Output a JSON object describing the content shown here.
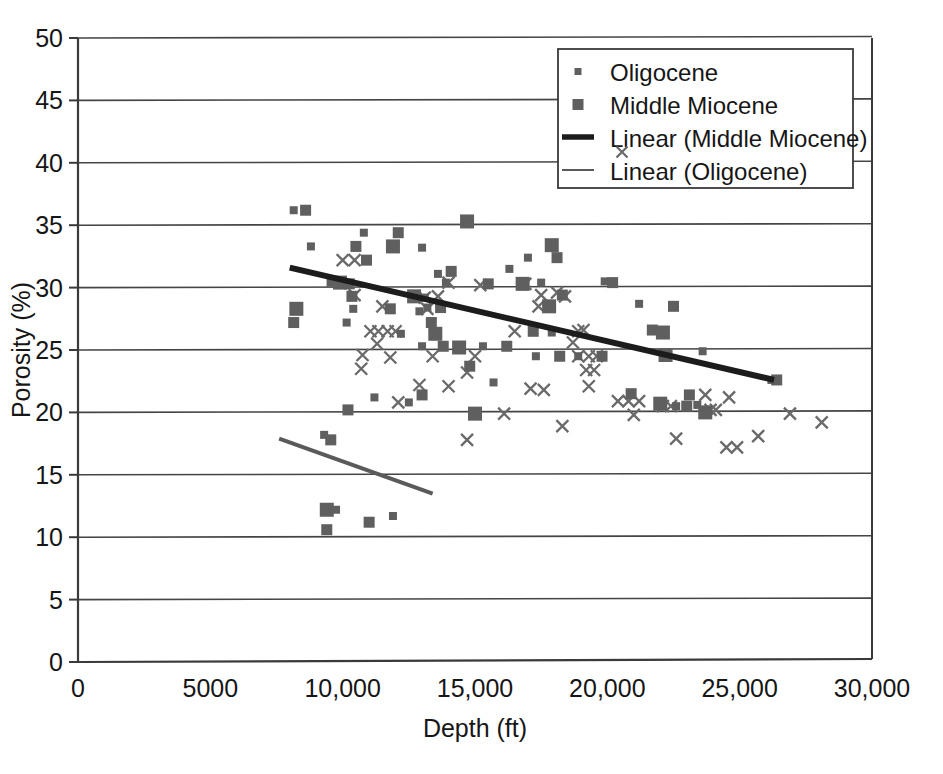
{
  "chart_data": {
    "type": "scatter",
    "title": "",
    "xlabel": "Depth (ft)",
    "ylabel": "Porosity (%)",
    "xlim": [
      0,
      30000
    ],
    "ylim": [
      0,
      50
    ],
    "xticks": [
      0,
      5000,
      10000,
      15000,
      20000,
      25000,
      30000
    ],
    "xtick_labels": [
      "0",
      "5000",
      "10,000",
      "15,000",
      "20,000",
      "25,000",
      "30,000"
    ],
    "yticks": [
      0,
      5,
      10,
      15,
      20,
      25,
      30,
      35,
      40,
      45,
      50
    ],
    "ytick_labels": [
      "0",
      "5",
      "10",
      "15",
      "20",
      "25",
      "30",
      "35",
      "40",
      "45",
      "50"
    ],
    "grid": "horizontal",
    "legend_position": "top-right",
    "marker_color": "#5f5f5f",
    "trend_miocene_color": "#1c1c1c",
    "trend_oligocene_color": "#5a5a5a",
    "axis_color": "#3a3a3a",
    "legend": [
      {
        "label": "Oligocene",
        "marker": "small-square",
        "color": "#5f5f5f"
      },
      {
        "label": "Middle Miocene",
        "marker": "square",
        "color": "#5f5f5f"
      },
      {
        "label": "Linear (Middle Miocene)",
        "marker": "thick-line",
        "color": "#1c1c1c"
      },
      {
        "label": "Linear (Oligocene)",
        "marker": "thin-line",
        "color": "#5a5a5a"
      }
    ],
    "series": [
      {
        "name": "Middle Miocene",
        "marker": "square",
        "color": "#5f5f5f",
        "points": [
          [
            8150,
            36.2
          ],
          [
            8600,
            36.2
          ],
          [
            14700,
            35.3
          ],
          [
            10800,
            34.4
          ],
          [
            12100,
            34.4
          ],
          [
            8800,
            33.3
          ],
          [
            10500,
            33.3
          ],
          [
            11900,
            33.3
          ],
          [
            13000,
            33.2
          ],
          [
            10900,
            32.2
          ],
          [
            17000,
            32.4
          ],
          [
            18100,
            32.4
          ],
          [
            17900,
            33.4
          ],
          [
            16300,
            31.5
          ],
          [
            14100,
            31.3
          ],
          [
            13600,
            31.1
          ],
          [
            9600,
            30.5
          ],
          [
            9900,
            30.4
          ],
          [
            10050,
            30.3
          ],
          [
            10250,
            30.3
          ],
          [
            13900,
            30.4
          ],
          [
            15500,
            30.3
          ],
          [
            16800,
            30.3
          ],
          [
            19900,
            30.5
          ],
          [
            20200,
            30.4
          ],
          [
            17500,
            30.4
          ],
          [
            10350,
            29.3
          ],
          [
            12700,
            29.3
          ],
          [
            13100,
            29.2
          ],
          [
            18300,
            29.4
          ],
          [
            21200,
            28.7
          ],
          [
            22500,
            28.5
          ],
          [
            8250,
            28.3
          ],
          [
            10400,
            28.3
          ],
          [
            11800,
            28.3
          ],
          [
            13200,
            28.4
          ],
          [
            13700,
            28.4
          ],
          [
            17800,
            28.5
          ],
          [
            12900,
            28.1
          ],
          [
            8150,
            27.2
          ],
          [
            10150,
            27.2
          ],
          [
            13350,
            27.2
          ],
          [
            13500,
            26.3
          ],
          [
            12200,
            26.3
          ],
          [
            17200,
            26.5
          ],
          [
            17900,
            26.4
          ],
          [
            21700,
            26.6
          ],
          [
            22100,
            26.4
          ],
          [
            13000,
            25.3
          ],
          [
            13800,
            25.3
          ],
          [
            15300,
            25.3
          ],
          [
            16200,
            25.3
          ],
          [
            14400,
            25.2
          ],
          [
            17300,
            24.5
          ],
          [
            18200,
            24.5
          ],
          [
            18900,
            24.5
          ],
          [
            19800,
            24.5
          ],
          [
            22200,
            24.6
          ],
          [
            23600,
            24.9
          ],
          [
            14800,
            23.7
          ],
          [
            15700,
            22.4
          ],
          [
            20900,
            21.5
          ],
          [
            22000,
            20.7
          ],
          [
            22600,
            20.5
          ],
          [
            23000,
            20.5
          ],
          [
            23400,
            20.6
          ],
          [
            23100,
            21.4
          ],
          [
            23700,
            20.0
          ],
          [
            11200,
            21.2
          ],
          [
            13000,
            21.4
          ],
          [
            12500,
            20.8
          ],
          [
            10200,
            20.2
          ],
          [
            15000,
            19.9
          ],
          [
            26200,
            22.6
          ],
          [
            26400,
            22.6
          ],
          [
            9300,
            18.2
          ],
          [
            9550,
            17.8
          ],
          [
            9400,
            12.2
          ],
          [
            9750,
            12.2
          ],
          [
            11000,
            11.2
          ],
          [
            11900,
            11.7
          ],
          [
            9400,
            10.6
          ]
        ]
      },
      {
        "name": "Oligocene",
        "marker": "x",
        "color": "#6a6a6a",
        "points": [
          [
            10000,
            32.2
          ],
          [
            10450,
            32.2
          ],
          [
            14000,
            30.4
          ],
          [
            15200,
            30.2
          ],
          [
            16900,
            30.3
          ],
          [
            10450,
            29.4
          ],
          [
            13100,
            29.2
          ],
          [
            13600,
            29.3
          ],
          [
            17500,
            29.4
          ],
          [
            18100,
            29.6
          ],
          [
            18400,
            29.3
          ],
          [
            11500,
            28.5
          ],
          [
            13200,
            28.3
          ],
          [
            17400,
            28.5
          ],
          [
            11050,
            26.5
          ],
          [
            11350,
            26.5
          ],
          [
            11700,
            26.5
          ],
          [
            12000,
            26.5
          ],
          [
            16500,
            26.5
          ],
          [
            18900,
            26.5
          ],
          [
            19100,
            26.6
          ],
          [
            11300,
            25.5
          ],
          [
            18700,
            25.6
          ],
          [
            10750,
            24.6
          ],
          [
            11800,
            24.4
          ],
          [
            13400,
            24.5
          ],
          [
            15000,
            24.5
          ],
          [
            18900,
            24.5
          ],
          [
            19300,
            24.5
          ],
          [
            19600,
            24.5
          ],
          [
            10700,
            23.5
          ],
          [
            19200,
            23.4
          ],
          [
            19500,
            23.4
          ],
          [
            14700,
            23.2
          ],
          [
            12900,
            22.2
          ],
          [
            14000,
            22.1
          ],
          [
            19300,
            22.1
          ],
          [
            17100,
            21.9
          ],
          [
            17600,
            21.8
          ],
          [
            12100,
            20.8
          ],
          [
            20400,
            20.9
          ],
          [
            20800,
            20.9
          ],
          [
            21200,
            20.9
          ],
          [
            16100,
            19.9
          ],
          [
            18300,
            18.9
          ],
          [
            22100,
            20.5
          ],
          [
            22400,
            20.5
          ],
          [
            23900,
            20.2
          ],
          [
            24100,
            20.2
          ],
          [
            23700,
            21.4
          ],
          [
            24600,
            21.2
          ],
          [
            14700,
            17.8
          ],
          [
            22600,
            17.9
          ],
          [
            24500,
            17.2
          ],
          [
            24900,
            17.2
          ],
          [
            25700,
            18.1
          ],
          [
            28100,
            19.2
          ],
          [
            26900,
            19.9
          ],
          [
            21000,
            19.8
          ]
        ]
      }
    ],
    "trendlines": [
      {
        "name": "Linear (Middle Miocene)",
        "x0": 8000,
        "y0": 31.6,
        "x1": 26300,
        "y1": 22.6,
        "color": "#1c1c1c",
        "width": 6
      },
      {
        "name": "Linear (Oligocene)",
        "x0": 7600,
        "y0": 17.9,
        "x1": 13400,
        "y1": 13.5,
        "color": "#5a5a5a",
        "width": 4
      }
    ]
  }
}
